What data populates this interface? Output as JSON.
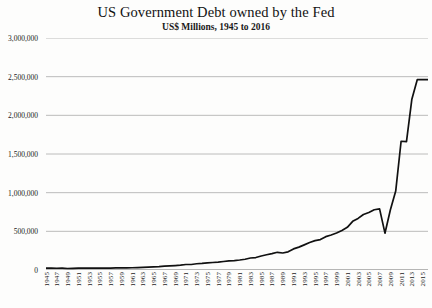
{
  "chart_data": {
    "type": "line",
    "title": "US Government Debt owned by the Fed",
    "subtitle": "US$ Millions, 1945 to 2016",
    "xlabel": "",
    "ylabel": "",
    "ylim": [
      0,
      3000000
    ],
    "xlim": [
      1945,
      2016
    ],
    "grid": true,
    "legend": false,
    "y_ticks": [
      "0",
      "500,000",
      "1,000,000",
      "1,500,000",
      "2,000,000",
      "2,500,000",
      "3,000,000"
    ],
    "y_tick_values": [
      0,
      500000,
      1000000,
      1500000,
      2000000,
      2500000,
      3000000
    ],
    "x_tick_labels": [
      "1945",
      "1947",
      "1949",
      "1951",
      "1953",
      "1955",
      "1957",
      "1959",
      "1961",
      "1963",
      "1965",
      "1967",
      "1969",
      "1971",
      "1973",
      "1975",
      "1977",
      "1979",
      "1981",
      "1983",
      "1985",
      "1987",
      "1989",
      "1991",
      "1993",
      "1995",
      "1997",
      "1999",
      "2001",
      "2003",
      "2005",
      "2007",
      "2009",
      "2011",
      "2013",
      "2015"
    ],
    "series": [
      {
        "name": "US Government Debt owned by the Fed",
        "color": "#111111",
        "x": [
          1945,
          1946,
          1947,
          1948,
          1949,
          1950,
          1951,
          1952,
          1953,
          1954,
          1955,
          1956,
          1957,
          1958,
          1959,
          1960,
          1961,
          1962,
          1963,
          1964,
          1965,
          1966,
          1967,
          1968,
          1969,
          1970,
          1971,
          1972,
          1973,
          1974,
          1975,
          1976,
          1977,
          1978,
          1979,
          1980,
          1981,
          1982,
          1983,
          1984,
          1985,
          1986,
          1987,
          1988,
          1989,
          1990,
          1991,
          1992,
          1993,
          1994,
          1995,
          1996,
          1997,
          1998,
          1999,
          2000,
          2001,
          2002,
          2003,
          2004,
          2005,
          2006,
          2007,
          2008,
          2009,
          2010,
          2011,
          2012,
          2013,
          2014,
          2015,
          2016
        ],
        "values": [
          24000,
          23500,
          22600,
          23300,
          19300,
          20800,
          23800,
          24700,
          25900,
          25000,
          24800,
          24900,
          23000,
          26300,
          26600,
          27400,
          28900,
          30800,
          33600,
          37000,
          40800,
          43800,
          49100,
          52900,
          57200,
          62100,
          70800,
          71400,
          80500,
          85000,
          92000,
          97000,
          102000,
          110000,
          117000,
          121000,
          129000,
          139000,
          155000,
          161000,
          181000,
          197000,
          212000,
          229000,
          220000,
          235000,
          273000,
          296000,
          325000,
          355000,
          380000,
          393000,
          431000,
          452000,
          478000,
          512000,
          552000,
          629000,
          667000,
          718000,
          744000,
          779000,
          790000,
          476000,
          776000,
          1021000,
          1665000,
          1660000,
          2209000,
          2461000,
          2462000,
          2463000
        ]
      }
    ],
    "annotations": []
  }
}
